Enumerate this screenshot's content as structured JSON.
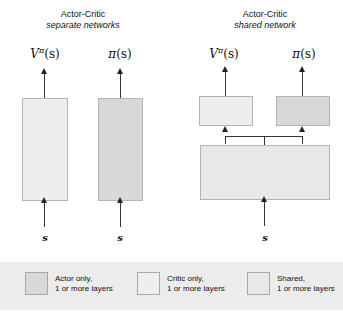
{
  "figure": {
    "panels": [
      {
        "id": "separate",
        "title_line1": "Actor-Critic",
        "title_line2": "separate networks",
        "outputs": [
          {
            "name": "value-function",
            "symbol": "V",
            "superscript": "π",
            "argument": "(s)"
          },
          {
            "name": "policy",
            "symbol": "π",
            "superscript": "",
            "argument": "(s)"
          }
        ],
        "inputs": [
          {
            "label": "s"
          },
          {
            "label": "s"
          }
        ],
        "boxes": [
          {
            "name": "critic-network",
            "role": "critic",
            "color": "#eeeeee"
          },
          {
            "name": "actor-network",
            "role": "actor",
            "color": "#d8d8d8"
          }
        ]
      },
      {
        "id": "shared",
        "title_line1": "Actor-Critic",
        "title_line2": "shared network",
        "outputs": [
          {
            "name": "value-function",
            "symbol": "V",
            "superscript": "π",
            "argument": "(s)"
          },
          {
            "name": "policy",
            "symbol": "π",
            "superscript": "",
            "argument": "(s)"
          }
        ],
        "inputs": [
          {
            "label": "s"
          }
        ],
        "boxes": [
          {
            "name": "critic-head",
            "role": "critic",
            "color": "#eeeeee"
          },
          {
            "name": "actor-head",
            "role": "actor",
            "color": "#d8d8d8"
          },
          {
            "name": "shared-trunk",
            "role": "shared",
            "color": "#e8e8e8"
          }
        ]
      }
    ],
    "legend": {
      "background": "#ececec",
      "items": [
        {
          "name": "legend-actor",
          "line1": "Actor only,",
          "line2": "1 or more layers",
          "color": "#d8d8d8"
        },
        {
          "name": "legend-critic",
          "line1": "Critic only,",
          "line2": "1 or more layers",
          "color": "#eeeeee"
        },
        {
          "name": "legend-shared",
          "line1": "Shared,",
          "line2": "1 or more layers",
          "color": "#e8e8e8"
        }
      ]
    }
  }
}
